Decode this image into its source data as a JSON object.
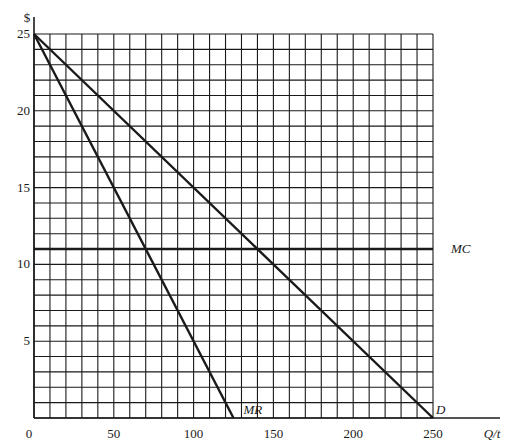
{
  "chart_data": {
    "type": "line",
    "title": "",
    "xlabel": "Q/t",
    "ylabel": "$",
    "xlim": [
      0,
      250
    ],
    "ylim": [
      0,
      25
    ],
    "grid": true,
    "grid_step": {
      "x": 10,
      "y": 1
    },
    "x_ticks": [
      0,
      50,
      100,
      150,
      200,
      250
    ],
    "x_tick_labels": [
      "0",
      "50",
      "100",
      "150",
      "200",
      "250"
    ],
    "y_ticks": [
      5,
      10,
      15,
      20,
      25
    ],
    "y_tick_labels": [
      "5",
      "10",
      "15",
      "20",
      "25"
    ],
    "series": [
      {
        "name": "D",
        "label": "D",
        "points": [
          [
            0,
            25
          ],
          [
            250,
            0
          ]
        ],
        "equation": "P = 25 - 0.1Q"
      },
      {
        "name": "MR",
        "label": "MR",
        "points": [
          [
            0,
            25
          ],
          [
            125,
            0
          ]
        ],
        "equation": "P = 25 - 0.2Q"
      },
      {
        "name": "MC",
        "label": "MC",
        "points": [
          [
            0,
            11
          ],
          [
            250,
            11
          ]
        ],
        "equation": "P = 11"
      }
    ],
    "annotations": [
      {
        "text": "MR",
        "at": [
          125,
          0
        ]
      },
      {
        "text": "D",
        "at": [
          250,
          0
        ]
      },
      {
        "text": "MC",
        "at": [
          250,
          11
        ]
      }
    ],
    "legend": "none (inline line labels)"
  },
  "axis": {
    "y_symbol": "$",
    "x_label": "Q/t",
    "origin_label": "0"
  },
  "colors": {
    "line": "#1a1a1a",
    "grid": "#1a1a1a",
    "background": "#ffffff"
  }
}
